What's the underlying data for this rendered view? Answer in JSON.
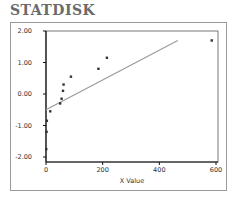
{
  "header": {
    "title": "STATDISK"
  },
  "chart_data": {
    "type": "scatter",
    "title": "",
    "xlabel": "X Value",
    "ylabel": "",
    "xlim": [
      0,
      600
    ],
    "ylim": [
      -2.0,
      2.0
    ],
    "x_ticks": [
      "0",
      "200",
      "400",
      "600"
    ],
    "y_ticks": [
      "2.00",
      "1.00",
      "0.00",
      "-1.00",
      "-2.00"
    ],
    "grid": false,
    "legend": null,
    "series": [
      {
        "name": "points",
        "x": [
          1,
          2,
          3,
          15,
          50,
          55,
          60,
          62,
          88,
          185,
          215,
          585
        ],
        "y": [
          -1.75,
          -1.2,
          -0.85,
          -0.55,
          -0.3,
          -0.15,
          0.1,
          0.3,
          0.55,
          0.8,
          1.15,
          1.7
        ]
      }
    ],
    "regression_line": {
      "x": [
        0,
        465
      ],
      "y": [
        -0.5,
        1.7
      ],
      "color": "#9a9a9a"
    }
  }
}
